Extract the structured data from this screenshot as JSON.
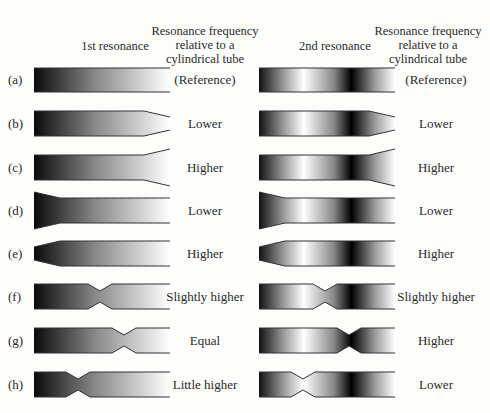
{
  "headers": {
    "col1": "1st resonance",
    "col2": [
      "Resonance frequency",
      "relative to a",
      "cylindrical tube"
    ],
    "col3": "2nd resonance",
    "col4": [
      "Resonance frequency",
      "relative to a",
      "cylindrical tube"
    ]
  },
  "rows": [
    {
      "label": "(a)",
      "shape": "cylinder",
      "first": "(Reference)",
      "second": "(Reference)"
    },
    {
      "label": "(b)",
      "shape": "narrowing-end",
      "first": "Lower",
      "second": "Lower"
    },
    {
      "label": "(c)",
      "shape": "widening-end",
      "first": "Higher",
      "second": "Higher"
    },
    {
      "label": "(d)",
      "shape": "wide-start",
      "first": "Lower",
      "second": "Lower"
    },
    {
      "label": "(e)",
      "shape": "narrow-start",
      "first": "Higher",
      "second": "Higher"
    },
    {
      "label": "(f)",
      "shape": "constriction-middle",
      "first": "Slightly higher",
      "second": "Slightly higher"
    },
    {
      "label": "(g)",
      "shape": "constriction-at-2nd-node",
      "first": "Equal",
      "second": "Higher"
    },
    {
      "label": "(h)",
      "shape": "constriction-near-start",
      "first": "Little higher",
      "second": "Lower"
    }
  ],
  "colors": {
    "dark": "#111111",
    "light": "#ffffff",
    "outline": "#333333"
  }
}
